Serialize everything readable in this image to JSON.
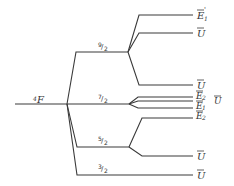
{
  "diagram": {
    "root": {
      "label": "4F",
      "sup": "4",
      "base": "F"
    },
    "levels": [
      {
        "j": "9/2",
        "num": "9",
        "den": "2",
        "components": [
          {
            "label": "Ē1'",
            "base": "E",
            "sub": "1",
            "prime": "'"
          },
          {
            "label": "Ū",
            "base": "U"
          },
          {
            "label": "Ū",
            "base": "U"
          }
        ]
      },
      {
        "j": "7/2",
        "num": "7",
        "den": "2",
        "components": [
          {
            "label": "Ē2",
            "base": "E",
            "sub": "2"
          },
          {
            "label": "Ū",
            "base": "U"
          },
          {
            "label": "Ē1",
            "base": "E",
            "sub": "1"
          }
        ]
      },
      {
        "j": "5/2",
        "num": "5",
        "den": "2",
        "components": [
          {
            "label": "Ē2",
            "base": "E",
            "sub": "2"
          },
          {
            "label": "Ū",
            "base": "U"
          }
        ]
      },
      {
        "j": "3/2",
        "num": "3",
        "den": "2",
        "components": [
          {
            "label": "Ū",
            "base": "U"
          }
        ]
      }
    ]
  }
}
